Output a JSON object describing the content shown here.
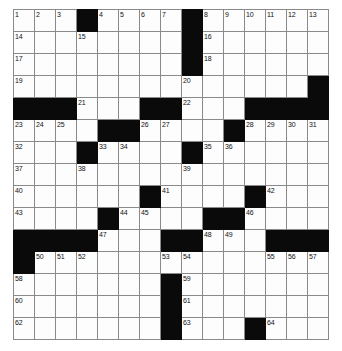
{
  "puzzle": {
    "title": "Crossword Grid",
    "columns": 15,
    "rows": 15,
    "colors": {
      "block": "#0a0a0a",
      "cell": "#fdfdfd",
      "grid_line": "#8a8a8a",
      "number_text": "#111111"
    },
    "grid": [
      [
        {
          "type": "open",
          "number": "1"
        },
        {
          "type": "open",
          "number": "2"
        },
        {
          "type": "open",
          "number": "3"
        },
        {
          "type": "block",
          "number": ""
        },
        {
          "type": "open",
          "number": "4"
        },
        {
          "type": "open",
          "number": "5"
        },
        {
          "type": "open",
          "number": "6"
        },
        {
          "type": "open",
          "number": "7"
        },
        {
          "type": "block",
          "number": ""
        },
        {
          "type": "open",
          "number": "8"
        },
        {
          "type": "open",
          "number": "9"
        },
        {
          "type": "open",
          "number": "10"
        },
        {
          "type": "open",
          "number": "11"
        },
        {
          "type": "open",
          "number": "12"
        },
        {
          "type": "open",
          "number": "13"
        }
      ],
      [
        {
          "type": "open",
          "number": "14"
        },
        {
          "type": "open",
          "number": ""
        },
        {
          "type": "open",
          "number": ""
        },
        {
          "type": "open",
          "number": "15"
        },
        {
          "type": "open",
          "number": ""
        },
        {
          "type": "open",
          "number": ""
        },
        {
          "type": "open",
          "number": ""
        },
        {
          "type": "open",
          "number": ""
        },
        {
          "type": "block",
          "number": ""
        },
        {
          "type": "open",
          "number": "16"
        },
        {
          "type": "open",
          "number": ""
        },
        {
          "type": "open",
          "number": ""
        },
        {
          "type": "open",
          "number": ""
        },
        {
          "type": "open",
          "number": ""
        },
        {
          "type": "open",
          "number": ""
        }
      ],
      [
        {
          "type": "open",
          "number": "17"
        },
        {
          "type": "open",
          "number": ""
        },
        {
          "type": "open",
          "number": ""
        },
        {
          "type": "open",
          "number": ""
        },
        {
          "type": "open",
          "number": ""
        },
        {
          "type": "open",
          "number": ""
        },
        {
          "type": "open",
          "number": ""
        },
        {
          "type": "open",
          "number": ""
        },
        {
          "type": "block",
          "number": ""
        },
        {
          "type": "open",
          "number": "18"
        },
        {
          "type": "open",
          "number": ""
        },
        {
          "type": "open",
          "number": ""
        },
        {
          "type": "open",
          "number": ""
        },
        {
          "type": "open",
          "number": ""
        },
        {
          "type": "open",
          "number": ""
        }
      ],
      [
        {
          "type": "open",
          "number": "19"
        },
        {
          "type": "open",
          "number": ""
        },
        {
          "type": "open",
          "number": ""
        },
        {
          "type": "open",
          "number": ""
        },
        {
          "type": "open",
          "number": ""
        },
        {
          "type": "open",
          "number": ""
        },
        {
          "type": "open",
          "number": ""
        },
        {
          "type": "open",
          "number": ""
        },
        {
          "type": "open",
          "number": "20"
        },
        {
          "type": "open",
          "number": ""
        },
        {
          "type": "open",
          "number": ""
        },
        {
          "type": "open",
          "number": ""
        },
        {
          "type": "open",
          "number": ""
        },
        {
          "type": "open",
          "number": ""
        },
        {
          "type": "block",
          "number": ""
        }
      ],
      [
        {
          "type": "block",
          "number": ""
        },
        {
          "type": "block",
          "number": ""
        },
        {
          "type": "block",
          "number": ""
        },
        {
          "type": "open",
          "number": "21"
        },
        {
          "type": "open",
          "number": ""
        },
        {
          "type": "open",
          "number": ""
        },
        {
          "type": "block",
          "number": ""
        },
        {
          "type": "block",
          "number": ""
        },
        {
          "type": "open",
          "number": "22"
        },
        {
          "type": "open",
          "number": ""
        },
        {
          "type": "open",
          "number": ""
        },
        {
          "type": "block",
          "number": ""
        },
        {
          "type": "block",
          "number": ""
        },
        {
          "type": "block",
          "number": ""
        },
        {
          "type": "block",
          "number": ""
        }
      ],
      [
        {
          "type": "open",
          "number": "23"
        },
        {
          "type": "open",
          "number": "24"
        },
        {
          "type": "open",
          "number": "25"
        },
        {
          "type": "open",
          "number": ""
        },
        {
          "type": "block",
          "number": ""
        },
        {
          "type": "block",
          "number": ""
        },
        {
          "type": "open",
          "number": "26"
        },
        {
          "type": "open",
          "number": "27"
        },
        {
          "type": "open",
          "number": ""
        },
        {
          "type": "open",
          "number": ""
        },
        {
          "type": "block",
          "number": ""
        },
        {
          "type": "open",
          "number": "28"
        },
        {
          "type": "open",
          "number": "29"
        },
        {
          "type": "open",
          "number": "30"
        },
        {
          "type": "open",
          "number": "31"
        }
      ],
      [
        {
          "type": "open",
          "number": "32"
        },
        {
          "type": "open",
          "number": ""
        },
        {
          "type": "open",
          "number": ""
        },
        {
          "type": "block",
          "number": ""
        },
        {
          "type": "open",
          "number": "33"
        },
        {
          "type": "open",
          "number": "34"
        },
        {
          "type": "open",
          "number": ""
        },
        {
          "type": "open",
          "number": ""
        },
        {
          "type": "block",
          "number": ""
        },
        {
          "type": "open",
          "number": "35"
        },
        {
          "type": "open",
          "number": "36"
        },
        {
          "type": "open",
          "number": ""
        },
        {
          "type": "open",
          "number": ""
        },
        {
          "type": "open",
          "number": ""
        },
        {
          "type": "open",
          "number": ""
        }
      ],
      [
        {
          "type": "open",
          "number": "37"
        },
        {
          "type": "open",
          "number": ""
        },
        {
          "type": "open",
          "number": ""
        },
        {
          "type": "open",
          "number": "38"
        },
        {
          "type": "open",
          "number": ""
        },
        {
          "type": "open",
          "number": ""
        },
        {
          "type": "open",
          "number": ""
        },
        {
          "type": "open",
          "number": ""
        },
        {
          "type": "open",
          "number": "39"
        },
        {
          "type": "open",
          "number": ""
        },
        {
          "type": "open",
          "number": ""
        },
        {
          "type": "open",
          "number": ""
        },
        {
          "type": "open",
          "number": ""
        },
        {
          "type": "open",
          "number": ""
        },
        {
          "type": "open",
          "number": ""
        }
      ],
      [
        {
          "type": "open",
          "number": "40"
        },
        {
          "type": "open",
          "number": ""
        },
        {
          "type": "open",
          "number": ""
        },
        {
          "type": "open",
          "number": ""
        },
        {
          "type": "open",
          "number": ""
        },
        {
          "type": "open",
          "number": ""
        },
        {
          "type": "block",
          "number": ""
        },
        {
          "type": "open",
          "number": "41"
        },
        {
          "type": "open",
          "number": ""
        },
        {
          "type": "open",
          "number": ""
        },
        {
          "type": "open",
          "number": ""
        },
        {
          "type": "block",
          "number": ""
        },
        {
          "type": "open",
          "number": "42"
        },
        {
          "type": "open",
          "number": ""
        },
        {
          "type": "open",
          "number": ""
        }
      ],
      [
        {
          "type": "open",
          "number": "43"
        },
        {
          "type": "open",
          "number": ""
        },
        {
          "type": "open",
          "number": ""
        },
        {
          "type": "open",
          "number": ""
        },
        {
          "type": "block",
          "number": ""
        },
        {
          "type": "open",
          "number": "44"
        },
        {
          "type": "open",
          "number": "45"
        },
        {
          "type": "open",
          "number": ""
        },
        {
          "type": "open",
          "number": ""
        },
        {
          "type": "block",
          "number": ""
        },
        {
          "type": "block",
          "number": ""
        },
        {
          "type": "open",
          "number": "46"
        },
        {
          "type": "open",
          "number": ""
        },
        {
          "type": "open",
          "number": ""
        },
        {
          "type": "open",
          "number": ""
        }
      ],
      [
        {
          "type": "block",
          "number": ""
        },
        {
          "type": "block",
          "number": ""
        },
        {
          "type": "block",
          "number": ""
        },
        {
          "type": "block",
          "number": ""
        },
        {
          "type": "open",
          "number": "47"
        },
        {
          "type": "open",
          "number": ""
        },
        {
          "type": "open",
          "number": ""
        },
        {
          "type": "block",
          "number": ""
        },
        {
          "type": "block",
          "number": ""
        },
        {
          "type": "open",
          "number": "48"
        },
        {
          "type": "open",
          "number": "49"
        },
        {
          "type": "open",
          "number": ""
        },
        {
          "type": "block",
          "number": ""
        },
        {
          "type": "block",
          "number": ""
        },
        {
          "type": "block",
          "number": ""
        }
      ],
      [
        {
          "type": "block",
          "number": ""
        },
        {
          "type": "open",
          "number": "50"
        },
        {
          "type": "open",
          "number": "51"
        },
        {
          "type": "open",
          "number": "52"
        },
        {
          "type": "open",
          "number": ""
        },
        {
          "type": "open",
          "number": ""
        },
        {
          "type": "open",
          "number": ""
        },
        {
          "type": "open",
          "number": "53"
        },
        {
          "type": "open",
          "number": "54"
        },
        {
          "type": "open",
          "number": ""
        },
        {
          "type": "open",
          "number": ""
        },
        {
          "type": "open",
          "number": ""
        },
        {
          "type": "open",
          "number": "55"
        },
        {
          "type": "open",
          "number": "56"
        },
        {
          "type": "open",
          "number": "57"
        }
      ],
      [
        {
          "type": "open",
          "number": "58"
        },
        {
          "type": "open",
          "number": ""
        },
        {
          "type": "open",
          "number": ""
        },
        {
          "type": "open",
          "number": ""
        },
        {
          "type": "open",
          "number": ""
        },
        {
          "type": "open",
          "number": ""
        },
        {
          "type": "open",
          "number": ""
        },
        {
          "type": "block",
          "number": ""
        },
        {
          "type": "open",
          "number": "59"
        },
        {
          "type": "open",
          "number": ""
        },
        {
          "type": "open",
          "number": ""
        },
        {
          "type": "open",
          "number": ""
        },
        {
          "type": "open",
          "number": ""
        },
        {
          "type": "open",
          "number": ""
        },
        {
          "type": "open",
          "number": ""
        }
      ],
      [
        {
          "type": "open",
          "number": "60"
        },
        {
          "type": "open",
          "number": ""
        },
        {
          "type": "open",
          "number": ""
        },
        {
          "type": "open",
          "number": ""
        },
        {
          "type": "open",
          "number": ""
        },
        {
          "type": "open",
          "number": ""
        },
        {
          "type": "open",
          "number": ""
        },
        {
          "type": "block",
          "number": ""
        },
        {
          "type": "open",
          "number": "61"
        },
        {
          "type": "open",
          "number": ""
        },
        {
          "type": "open",
          "number": ""
        },
        {
          "type": "open",
          "number": ""
        },
        {
          "type": "open",
          "number": ""
        },
        {
          "type": "open",
          "number": ""
        },
        {
          "type": "open",
          "number": ""
        }
      ],
      [
        {
          "type": "open",
          "number": "62"
        },
        {
          "type": "open",
          "number": ""
        },
        {
          "type": "open",
          "number": ""
        },
        {
          "type": "open",
          "number": ""
        },
        {
          "type": "open",
          "number": ""
        },
        {
          "type": "open",
          "number": ""
        },
        {
          "type": "open",
          "number": ""
        },
        {
          "type": "block",
          "number": ""
        },
        {
          "type": "open",
          "number": "63"
        },
        {
          "type": "open",
          "number": ""
        },
        {
          "type": "open",
          "number": ""
        },
        {
          "type": "block",
          "number": ""
        },
        {
          "type": "open",
          "number": "64"
        },
        {
          "type": "open",
          "number": ""
        },
        {
          "type": "open",
          "number": ""
        }
      ]
    ]
  }
}
